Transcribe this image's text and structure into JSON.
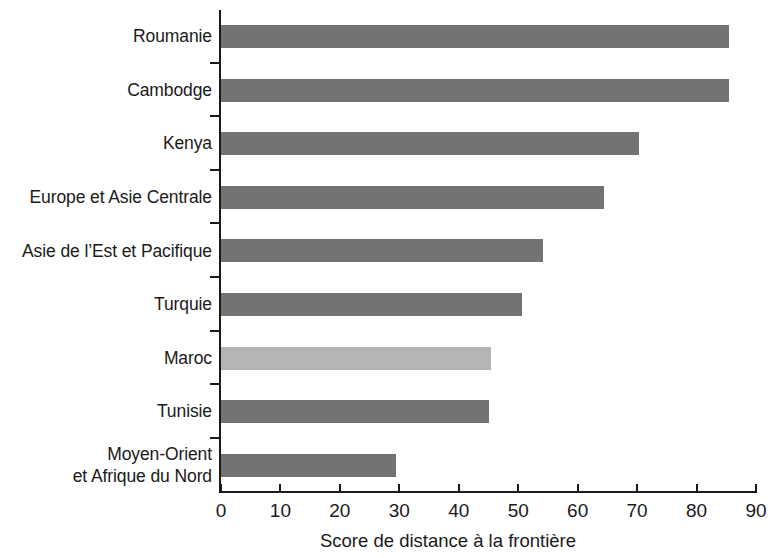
{
  "chart_data": {
    "type": "bar",
    "orientation": "horizontal",
    "title": "",
    "subtitle": "",
    "xlabel": "Score de distance à la frontière",
    "ylabel": "",
    "xlim": [
      0,
      90
    ],
    "xticks": [
      0,
      10,
      20,
      30,
      40,
      50,
      60,
      70,
      80,
      90
    ],
    "xtick_labels": [
      "0",
      "10",
      "20",
      "30",
      "40",
      "50",
      "60",
      "70",
      "80",
      "90"
    ],
    "grid": false,
    "legend": null,
    "categories": [
      "Roumanie",
      "Cambodge",
      "Kenya",
      "Europe et Asie Centrale",
      "Asie de l’Est et Pacifique",
      "Turquie",
      "Maroc",
      "Tunisie",
      "Moyen-Orient\net Afrique du Nord"
    ],
    "values": [
      85.5,
      85.5,
      70.4,
      64.5,
      54.2,
      50.7,
      45.5,
      45.0,
      29.5
    ],
    "bar_colors": [
      "#737373",
      "#737373",
      "#737373",
      "#737373",
      "#737373",
      "#737373",
      "#b5b5b5",
      "#737373",
      "#737373"
    ],
    "highlighted_category": "Maroc",
    "colors": {
      "bar_default": "#737373",
      "bar_highlight": "#b5b5b5",
      "axis": "#1a1a1a",
      "background": "#ffffff"
    }
  }
}
